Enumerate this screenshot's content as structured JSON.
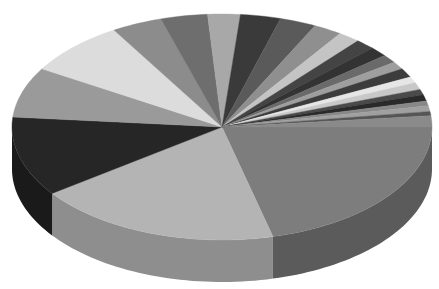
{
  "chart_data": {
    "type": "pie",
    "variant": "3d",
    "title": "",
    "legend": "none",
    "labels_visible": false,
    "note": "Unlabeled grayscale 3D pie; values estimated as percent of 360 degrees from slice boundaries, clockwise from the right (3 o'clock).",
    "categories": [
      "S1",
      "S2",
      "S3",
      "S4",
      "S5",
      "S6",
      "S7",
      "S8",
      "S9",
      "S10",
      "S11",
      "S12",
      "S13",
      "S14",
      "S15",
      "S16",
      "S17",
      "S18",
      "S19",
      "S20",
      "S21",
      "S22",
      "S23",
      "S24",
      "S25"
    ],
    "values": [
      21.1,
      18.9,
      11.4,
      7.2,
      7.8,
      3.9,
      3.6,
      2.5,
      3.1,
      2.8,
      2.2,
      1.7,
      1.5,
      1.4,
      1.2,
      1.1,
      1.3,
      0.9,
      1.0,
      0.8,
      0.9,
      0.7,
      0.8,
      0.6,
      1.6
    ],
    "colors": [
      "#7d7d7d",
      "#b4b4b4",
      "#262626",
      "#9a9a9a",
      "#dcdcdc",
      "#8c8c8c",
      "#6e6e6e",
      "#a8a8a8",
      "#3a3a3a",
      "#5a5a5a",
      "#8f8f8f",
      "#c4c4c4",
      "#444444",
      "#333333",
      "#6a6a6a",
      "#9e9e9e",
      "#3c3c3c",
      "#e6e6e6",
      "#c8c8c8",
      "#4a4a4a",
      "#2a2a2a",
      "#888888",
      "#a0a0a0",
      "#555555",
      "#8a8a8a"
    ],
    "geometry": {
      "cx": 222,
      "cy": 127,
      "rx": 210,
      "ry": 113,
      "depth": 42
    }
  }
}
